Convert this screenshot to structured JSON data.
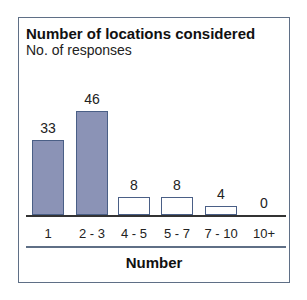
{
  "chart_data": {
    "type": "bar",
    "title": "Number of locations considered",
    "subtitle": "No. of responses",
    "xlabel": "Number",
    "ylabel": "No. of responses",
    "categories": [
      "1",
      "2 - 3",
      "4 - 5",
      "5 - 7",
      "7 - 10",
      "10+"
    ],
    "values": [
      33,
      46,
      8,
      8,
      4,
      0
    ],
    "value_labels": [
      "33",
      "46",
      "8",
      "8",
      "4",
      "0"
    ],
    "highlighted": [
      true,
      true,
      false,
      false,
      false,
      false
    ],
    "ylim": [
      0,
      50
    ],
    "grid": false,
    "legend": null,
    "colors": {
      "highlight_fill": "#8b93b6",
      "bar_outline": "#4a5f86",
      "frame": "#5f6f86"
    }
  }
}
